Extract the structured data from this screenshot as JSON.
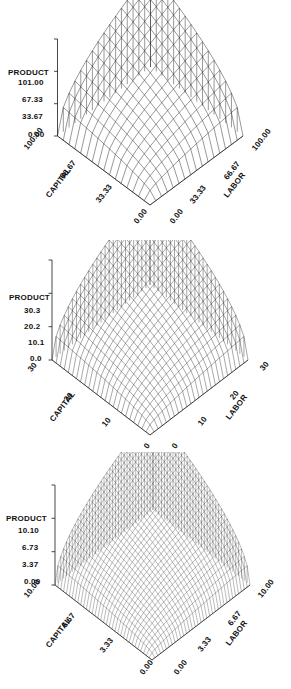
{
  "figure": {
    "type": "multi-panel-3d-surface",
    "panel_count": 3,
    "background": "#ffffff",
    "line_color": "#1a1a1a"
  },
  "chart_data": [
    {
      "type": "surface",
      "title": "",
      "zlabel": "PRODUCT",
      "xlabel": "CAPITAL",
      "ylabel": "LABOR",
      "z_ticks": [
        "101.00",
        "67.33",
        "33.67",
        "0.00"
      ],
      "z_values": [
        101.0,
        67.33,
        33.67,
        0.0
      ],
      "zlim": [
        0.0,
        101.0
      ],
      "x_ticks": [
        "100.00",
        "66.67",
        "33.33",
        "0.00"
      ],
      "x_values": [
        100.0,
        66.67,
        33.33,
        0.0
      ],
      "xlim": [
        0.0,
        100.0
      ],
      "y_ticks": [
        "0.00",
        "33.33",
        "66.67",
        "100.00"
      ],
      "y_values": [
        0.0,
        33.33,
        66.67,
        100.0
      ],
      "ylim": [
        0.0,
        100.0
      ],
      "mesh_n": 16,
      "grid": true,
      "legend": "none",
      "surface_form": "z = (x*y)^0.5 scaled so max z = 101.00 at x=100, y=100",
      "z_at_corners": {
        "x0_y0": 0.0,
        "xmax_y0": 0.0,
        "x0_ymax": 0.0,
        "xmax_ymax": 101.0
      }
    },
    {
      "type": "surface",
      "title": "",
      "zlabel": "PRODUCT",
      "xlabel": "CAPITAL",
      "ylabel": "LABOR",
      "z_ticks": [
        "30.3",
        "20.2",
        "10.1",
        "0.0"
      ],
      "z_values": [
        30.3,
        20.2,
        10.1,
        0.0
      ],
      "zlim": [
        0.0,
        30.3
      ],
      "x_ticks": [
        "30",
        "20",
        "10",
        "0"
      ],
      "x_values": [
        30,
        20,
        10,
        0
      ],
      "xlim": [
        0,
        30
      ],
      "y_ticks": [
        "0",
        "10",
        "20",
        "30"
      ],
      "y_values": [
        0,
        10,
        20,
        30
      ],
      "ylim": [
        0,
        30
      ],
      "mesh_n": 24,
      "grid": true,
      "legend": "none",
      "surface_form": "z = (x*y)^0.5 scaled so max z = 30.3 at x=30, y=30",
      "z_at_corners": {
        "x0_y0": 0.0,
        "xmax_y0": 0.0,
        "x0_ymax": 0.0,
        "xmax_ymax": 30.3
      }
    },
    {
      "type": "surface",
      "title": "",
      "zlabel": "PRODUCT",
      "xlabel": "CAPITAL",
      "ylabel": "LABOR",
      "z_ticks": [
        "10.10",
        "6.73",
        "3.37",
        "0.00"
      ],
      "z_values": [
        10.1,
        6.73,
        3.37,
        0.0
      ],
      "zlim": [
        0.0,
        10.1
      ],
      "x_ticks": [
        "10.00",
        "6.67",
        "3.33",
        "0.00"
      ],
      "x_values": [
        10.0,
        6.67,
        3.33,
        0.0
      ],
      "xlim": [
        0.0,
        10.0
      ],
      "y_ticks": [
        "0.00",
        "3.33",
        "6.67",
        "10.00"
      ],
      "y_values": [
        0.0,
        3.33,
        6.67,
        10.0
      ],
      "ylim": [
        0.0,
        10.0
      ],
      "mesh_n": 34,
      "grid": true,
      "legend": "none",
      "surface_form": "z = (x*y)^0.5 scaled so max z = 10.10 at x=10, y=10",
      "z_at_corners": {
        "x0_y0": 0.0,
        "xmax_y0": 0.0,
        "x0_ymax": 0.0,
        "xmax_ymax": 10.1
      }
    }
  ],
  "panels": [
    {
      "id": "panel-1",
      "zlabel": "PRODUCT",
      "xlabel": "CAPITAL",
      "ylabel": "LABOR",
      "z_ticks": [
        "101.00",
        "67.33",
        "33.67",
        "0.00"
      ],
      "x_ticks": [
        "100.00",
        "66.67",
        "33.33",
        "0.00"
      ],
      "y_ticks": [
        "0.00",
        "33.33",
        "66.67",
        "100.00"
      ]
    },
    {
      "id": "panel-2",
      "zlabel": "PRODUCT",
      "xlabel": "CAPITAL",
      "ylabel": "LABOR",
      "z_ticks": [
        "30.3",
        "20.2",
        "10.1",
        "0.0"
      ],
      "x_ticks": [
        "30",
        "20",
        "10",
        "0"
      ],
      "y_ticks": [
        "0",
        "10",
        "20",
        "30"
      ]
    },
    {
      "id": "panel-3",
      "zlabel": "PRODUCT",
      "xlabel": "CAPITAL",
      "ylabel": "LABOR",
      "z_ticks": [
        "10.10",
        "6.73",
        "3.37",
        "0.00"
      ],
      "x_ticks": [
        "10.00",
        "6.67",
        "3.33",
        "0.00"
      ],
      "y_ticks": [
        "0.00",
        "3.33",
        "6.67",
        "10.00"
      ]
    }
  ]
}
